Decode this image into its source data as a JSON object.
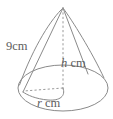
{
  "figure": {
    "kind": "cone",
    "stroke_color": "#8a8a8a",
    "dashed_stroke_color": "#9a9a9a",
    "text_color": "#5d5d5d",
    "background_color": "#ffffff",
    "labels": {
      "slant": {
        "value": "9",
        "unit": "cm",
        "text": "9cm"
      },
      "height": {
        "variable": "h",
        "unit": "cm",
        "text": "h cm"
      },
      "radius": {
        "variable": "r",
        "unit": "cm",
        "text": "r cm"
      }
    },
    "geometry": {
      "apex": {
        "x": 63,
        "y": 8
      },
      "base_center": {
        "x": 63,
        "y": 88
      },
      "base_rx": 45,
      "base_ry": 23,
      "base_left": {
        "x": 18,
        "y": 88
      },
      "base_right": {
        "x": 108,
        "y": 88
      }
    }
  }
}
